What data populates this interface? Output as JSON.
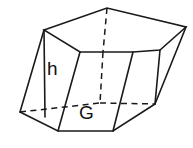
{
  "figure": {
    "kind": "geometry-diagram",
    "shape_name": "oblique hexagonal prism",
    "background_color": "#ffffff",
    "stroke_color": "#1a1a1a",
    "face_fill_color": "#ffffff",
    "labels": [
      {
        "id": "height",
        "text": "h",
        "x": 47,
        "y": 59
      },
      {
        "id": "base-area",
        "text": "G",
        "x": 79,
        "y": 103
      }
    ],
    "label_h": "h",
    "label_G": "G"
  }
}
